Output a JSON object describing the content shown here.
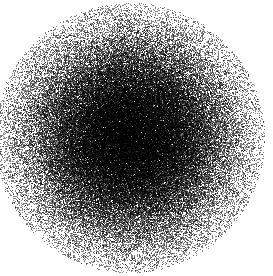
{
  "figure": {
    "width": 273,
    "height": 276,
    "background_color": "#ffffff",
    "title": "",
    "has_axes": false,
    "has_gridlines": false,
    "has_legend": false,
    "has_tick_labels": false
  },
  "chart_data": {
    "type": "scatter",
    "title": "",
    "xlabel": "",
    "ylabel": "",
    "grid": false,
    "legend_position": "none",
    "xlim": [
      0,
      273
    ],
    "ylim": [
      0,
      276
    ],
    "point_color": "#000000",
    "point_size_px": 1,
    "point_alpha": 0.5,
    "n_points": 120000,
    "distribution": "gaussian-2d-isotropic",
    "center_x": 130,
    "center_y": 138,
    "sigma_x": 52,
    "sigma_y": 52,
    "radial_extent_px": 135,
    "density_description": "saturated black core fading radially to sparse isolated points at the edges",
    "series": [
      {
        "name": "points",
        "mean": [
          130,
          138
        ],
        "sigma": [
          52,
          52
        ],
        "correlation": 0.0,
        "color": "#000000"
      }
    ]
  }
}
